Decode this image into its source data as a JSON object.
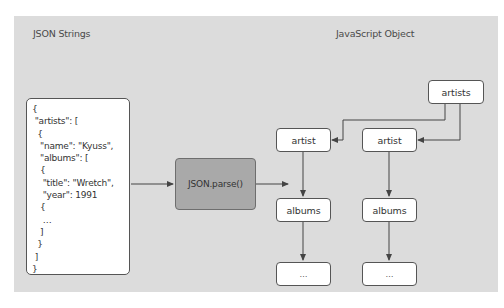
{
  "left_section": {
    "label": "JSON Strings",
    "json_lines": [
      "{",
      " \"artists\": [",
      "  {",
      "   \"name\": \"Kyuss\",",
      "   \"albums\": [",
      "   {",
      "    \"title\": \"Wretch\",",
      "    \"year\": 1991",
      "   {",
      "    …",
      "   ]",
      "  }",
      " ]",
      "}"
    ]
  },
  "parser": {
    "label": "JSON.parse()"
  },
  "right_section": {
    "label": "JavaScript Object",
    "root": {
      "label": "artists"
    },
    "columns": [
      {
        "artist": "artist",
        "albums": "albums",
        "more": "…"
      },
      {
        "artist": "artist",
        "albums": "albums",
        "more": "…"
      }
    ]
  },
  "colors": {
    "panel_bg": "#dcdcdc",
    "node_bg": "#ffffff",
    "parser_bg": "#a9a9a9",
    "line": "#444444"
  }
}
